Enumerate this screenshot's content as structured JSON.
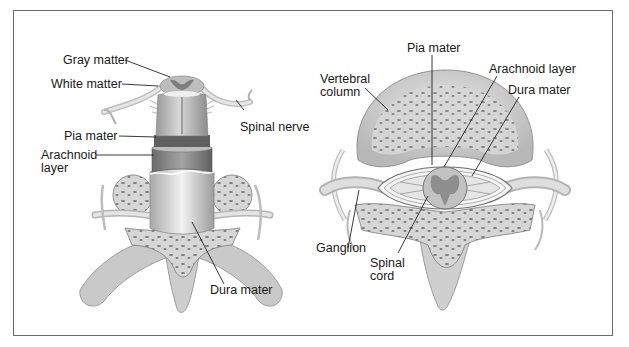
{
  "figure": {
    "panels": [
      {
        "name": "posterior-view",
        "labels": {
          "gray_matter": "Gray matter",
          "white_matter": "White matter",
          "spinal_nerve": "Spinal nerve",
          "pia_mater": "Pia mater",
          "arachnoid_line1": "Arachnoid",
          "arachnoid_line2": "layer",
          "dura_mater": "Dura mater"
        }
      },
      {
        "name": "cross-section-view",
        "labels": {
          "pia_mater": "Pia mater",
          "vertebral_line1": "Vertebral",
          "vertebral_line2": "column",
          "arachnoid_layer": "Arachnoid layer",
          "dura_mater": "Dura mater",
          "ganglion": "Ganglion",
          "spinal_line1": "Spinal",
          "spinal_line2": "cord"
        }
      }
    ],
    "colors": {
      "frame": "#6b6b6b",
      "bone": "#d9d9d9",
      "bone_dark": "#a8a8a8",
      "dura": "#cfcfcf",
      "arachnoid": "#8e8e8e",
      "pia": "#6e6e6e",
      "leader": "#222222"
    }
  }
}
